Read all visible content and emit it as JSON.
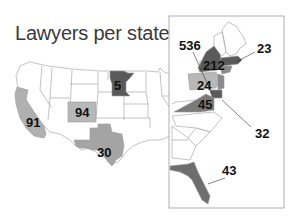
{
  "title": "Lawyers per state",
  "colors": {
    "dark": "#555555",
    "mid": "#8a8a8a",
    "light": "#b8b8b8",
    "border": "#9a9a9a",
    "inset_border": "#999999"
  },
  "states": [
    {
      "name": "California",
      "value": "91",
      "shade": "light"
    },
    {
      "name": "Colorado",
      "value": "94",
      "shade": "light"
    },
    {
      "name": "Texas",
      "value": "30",
      "shade": "light"
    },
    {
      "name": "Minnesota",
      "value": "5",
      "shade": "dark"
    },
    {
      "name": "New York",
      "value": "536",
      "shade": "dark"
    },
    {
      "name": "New York (upstate)",
      "value": "212",
      "shade": "dark"
    },
    {
      "name": "Massachusetts",
      "value": "23",
      "shade": "dark"
    },
    {
      "name": "Pennsylvania",
      "value": "24",
      "shade": "light"
    },
    {
      "name": "Virginia",
      "value": "45",
      "shade": "mid"
    },
    {
      "name": "Maryland/DC",
      "value": "32",
      "shade": "dark"
    },
    {
      "name": "Florida",
      "value": "43",
      "shade": "mid"
    }
  ],
  "labels": {
    "ca": "91",
    "co": "94",
    "tx": "30",
    "mn": "5",
    "ny_city": "536",
    "ny": "212",
    "ma": "23",
    "pa": "24",
    "va": "45",
    "md": "32",
    "fl": "43"
  }
}
